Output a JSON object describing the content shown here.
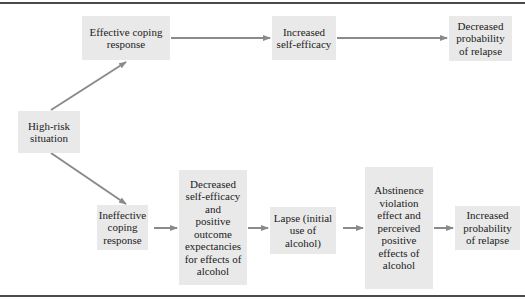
{
  "diagram": {
    "type": "flowchart",
    "title": "",
    "nodes": [
      {
        "id": "high_risk",
        "label": "High-risk\nsituation"
      },
      {
        "id": "effective",
        "label": "Effective coping\nresponse"
      },
      {
        "id": "inc_self_eff",
        "label": "Increased\nself-efficacy"
      },
      {
        "id": "dec_prob",
        "label": "Decreased\nprobability\nof relapse"
      },
      {
        "id": "ineffective",
        "label": "Ineffective\ncoping\nresponse"
      },
      {
        "id": "dec_self_eff",
        "label": "Decreased\nself-efficacy\nand\npositive\noutcome\nexpectancies\nfor effects of\nalcohol"
      },
      {
        "id": "lapse",
        "label": "Lapse (initial\nuse of\nalcohol)"
      },
      {
        "id": "ave",
        "label": "Abstinence\nviolation\neffect and\nperceived\npositive\neffects of\nalcohol"
      },
      {
        "id": "inc_prob",
        "label": "Increased\nprobability\nof relapse"
      }
    ],
    "edges": [
      {
        "from": "high_risk",
        "to": "effective"
      },
      {
        "from": "effective",
        "to": "inc_self_eff"
      },
      {
        "from": "inc_self_eff",
        "to": "dec_prob"
      },
      {
        "from": "high_risk",
        "to": "ineffective"
      },
      {
        "from": "ineffective",
        "to": "dec_self_eff"
      },
      {
        "from": "dec_self_eff",
        "to": "lapse"
      },
      {
        "from": "lapse",
        "to": "ave"
      },
      {
        "from": "ave",
        "to": "inc_prob"
      }
    ]
  },
  "colors": {
    "box_fill": "#e9e9e9",
    "arrow": "#8a8a8a",
    "rule": "#4a4a4a"
  }
}
